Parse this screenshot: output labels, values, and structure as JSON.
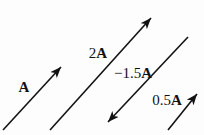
{
  "figure": {
    "background": "#fdfdfd",
    "line_color": "#131313",
    "vectors": [
      {
        "id": "a",
        "prefix": "",
        "symbol": "A",
        "x1": 3,
        "y1": 130,
        "x2": 61,
        "y2": 67,
        "label_x": 24,
        "label_y": 92
      },
      {
        "id": "2a",
        "prefix": "2",
        "symbol": "A",
        "x1": 50,
        "y1": 130,
        "x2": 151,
        "y2": 18,
        "label_x": 98,
        "label_y": 58
      },
      {
        "id": "minus-1-5a",
        "prefix": "−1.5",
        "symbol": "A",
        "x1": 188,
        "y1": 37,
        "x2": 108,
        "y2": 122,
        "label_x": 133,
        "label_y": 78
      },
      {
        "id": "0-5a",
        "prefix": "0.5",
        "symbol": "A",
        "x1": 168,
        "y1": 130,
        "x2": 197,
        "y2": 94,
        "label_x": 167,
        "label_y": 105
      }
    ]
  }
}
